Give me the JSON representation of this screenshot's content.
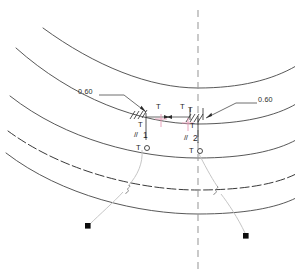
{
  "drawing": {
    "title": "Weld symbol detail on curved plate edges",
    "centerline": {
      "name": "vertical-centerline",
      "x": 198,
      "style": "dashed"
    },
    "colors": {
      "arc_stroke": "#3a3a3a",
      "hidden_arc_stroke": "#2e2e2e",
      "leader_stroke": "#b9b9b9",
      "symbol_stroke": "#1f1f1f",
      "centerline_stroke": "#9a9a9a",
      "cross_marker": "#e79ab5",
      "terminator_fill": "#0d0d0d",
      "background": "#ffffff"
    },
    "dimensions": [
      {
        "name": "leg-size-left",
        "value": "0.60",
        "x": 104,
        "y": 92
      },
      {
        "name": "leg-size-right",
        "value": "0.60",
        "x": 240,
        "y": 100
      }
    ],
    "weld_clusters": [
      {
        "name": "weld-cluster-left",
        "labels": {
          "upper_T": "T",
          "lower_T": "T",
          "parallel": "//",
          "index": "1",
          "circle_T": "T"
        },
        "positions": {
          "upper_T": 148,
          "cluster_x": 131
        }
      },
      {
        "name": "weld-cluster-right",
        "labels": {
          "upper_T": "T",
          "upper_T2": "T",
          "lower_T": "T",
          "parallel": "//",
          "index": "2",
          "circle_T": "T"
        },
        "positions": {
          "cluster_x": 180
        }
      }
    ],
    "arcs": [
      {
        "name": "arc-1",
        "style": "solid"
      },
      {
        "name": "arc-2",
        "style": "solid"
      },
      {
        "name": "arc-3",
        "style": "solid"
      },
      {
        "name": "arc-4",
        "style": "hidden-dashed"
      },
      {
        "name": "arc-5",
        "style": "solid"
      }
    ],
    "terminators": [
      {
        "name": "leader-terminator-left",
        "x": 88,
        "y": 226
      },
      {
        "name": "leader-terminator-right",
        "x": 246,
        "y": 236
      }
    ]
  }
}
